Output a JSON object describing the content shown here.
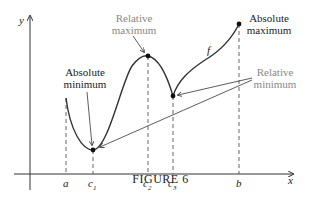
{
  "figure": {
    "caption": "FIGURE 6",
    "axes": {
      "x_label": "x",
      "y_label": "y"
    },
    "function_label": "f",
    "ticks": [
      "a",
      "c",
      "c",
      "c",
      "b"
    ],
    "tick_subscripts": [
      "",
      "1",
      "2",
      "3",
      ""
    ],
    "annotations": {
      "absolute_minimum": [
        "Absolute",
        "minimum"
      ],
      "relative_maximum": [
        "Relative",
        "maximum"
      ],
      "absolute_maximum": [
        "Absolute",
        "maximum"
      ],
      "relative_minimum": [
        "Relative",
        "minimum"
      ]
    },
    "colors": {
      "curve": "#333333",
      "label_dark": "#222222",
      "label_gray": "#888888"
    }
  }
}
